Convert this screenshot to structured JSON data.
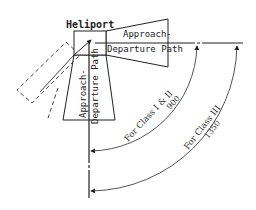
{
  "diagram": {
    "title_label": "Heliport",
    "right_path_label_line1": "Approach-",
    "right_path_label_line2": "Departure Path",
    "bottom_path_label_line1": "Approach-",
    "bottom_path_label_line2": "Departure Path",
    "arc_inner_label_line1": "For Class I & II",
    "arc_inner_label_line2": "900",
    "arc_outer_label_line1": "For Class III",
    "arc_outer_label_line2": "1350",
    "colors": {
      "line": "#222222",
      "arc": "#555555",
      "dashed": "#444444",
      "background": "#ffffff"
    }
  }
}
